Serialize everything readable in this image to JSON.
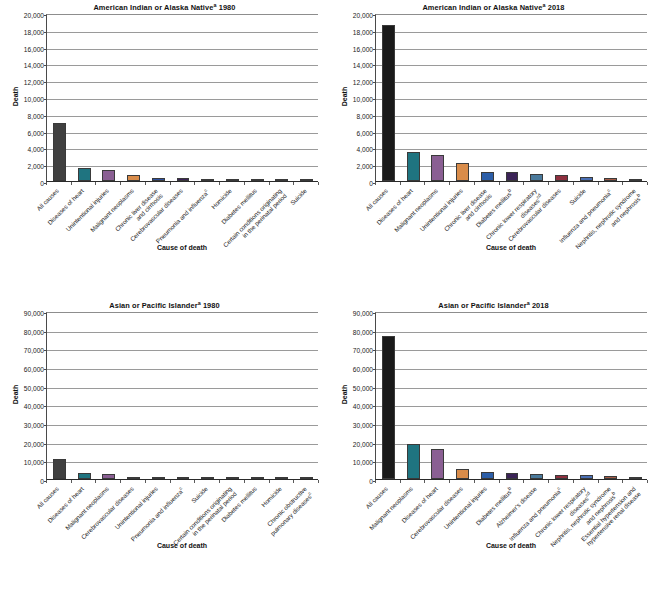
{
  "figure": {
    "axis_labels": {
      "x": "Cause of death",
      "y": "Death"
    },
    "caption": ""
  },
  "chart_data": [
    {
      "id": "american-indian-alaska-native-1980",
      "type": "bar",
      "title": "American Indian or Alaska Nativeᵃ 1980",
      "title_main": "American Indian or Alaska Native",
      "title_sup": "a",
      "title_year": "1980",
      "xlabel": "Cause of death",
      "ylabel": "Death",
      "ylim": [
        0,
        20000
      ],
      "yticks": [
        0,
        2000,
        4000,
        6000,
        8000,
        10000,
        12000,
        14000,
        16000,
        18000,
        20000
      ],
      "ytick_labels": [
        "0",
        "2,000",
        "4,000",
        "6,000",
        "8,000",
        "10,000",
        "12,000",
        "14,000",
        "16,000",
        "18,000",
        "20,000"
      ],
      "grid": true,
      "legend": "none",
      "categories": [
        "All causes",
        "Diseases of heart",
        "Unintentional injuries",
        "Malignant neoplasms",
        "Chronic liver disease and cirrhosis",
        "Cerebrovascular diseases",
        "Pneumonia and influenzaᶜ",
        "Homicide",
        "Diabetes mellitus",
        "Certain conditions originating in the perinatal period",
        "Suicide"
      ],
      "category_lines": [
        [
          "All causes"
        ],
        [
          "Diseases of heart"
        ],
        [
          "Unintentional injuries"
        ],
        [
          "Malignant neoplasms"
        ],
        [
          "Chronic liver disease",
          "and cirrhosis"
        ],
        [
          "Cerebrovascular diseases"
        ],
        [
          "Pneumonia and influenzaᶜ"
        ],
        [
          "Homicide"
        ],
        [
          "Diabetes mellitus"
        ],
        [
          "Certain conditions originating",
          "in the perinatal period"
        ],
        [
          "Suicide"
        ]
      ],
      "values": [
        6923,
        1494,
        1290,
        770,
        410,
        322,
        257,
        217,
        210,
        199,
        181
      ],
      "colors": [
        "#404040",
        "#1f7480",
        "#8a5f93",
        "#d98c4a",
        "#2c4f9e",
        "#3b2357",
        "#4a6d8c",
        "#8e2f3e",
        "#5b4fa0",
        "#a55b46",
        "#2f5c3a"
      ]
    },
    {
      "id": "american-indian-alaska-native-2018",
      "type": "bar",
      "title": "American Indian or Alaska Nativeᵃ 2018",
      "title_main": "American Indian or Alaska Native",
      "title_sup": "a",
      "title_year": "2018",
      "xlabel": "Cause of death",
      "ylabel": "Death",
      "ylim": [
        0,
        20000
      ],
      "yticks": [
        0,
        2000,
        4000,
        6000,
        8000,
        10000,
        12000,
        14000,
        16000,
        18000,
        20000
      ],
      "ytick_labels": [
        "0",
        "2,000",
        "4,000",
        "6,000",
        "8,000",
        "10,000",
        "12,000",
        "14,000",
        "16,000",
        "18,000",
        "20,000"
      ],
      "grid": true,
      "legend": "none",
      "categories": [
        "All causes",
        "Diseases of heart",
        "Malignant neoplasms",
        "Unintentional injuries",
        "Chronic liver disease and cirrhosis",
        "Diabetes mellitusᵇ",
        "Chronic lower respiratory diseasesᶜᵈ",
        "Cerebrovascular diseases",
        "Suicide",
        "Influenza and pneumoniaᶜ",
        "Nephritis, nephrotic syndrome and nephrosisᵇ"
      ],
      "category_lines": [
        [
          "All causes"
        ],
        [
          "Diseases of heart"
        ],
        [
          "Malignant neoplasms"
        ],
        [
          "Unintentional injuries"
        ],
        [
          "Chronic liver disease",
          "and cirrhosis"
        ],
        [
          "Diabetes mellitusᵇ"
        ],
        [
          "Chronic lower respiratory",
          "diseasesᶜᵈ"
        ],
        [
          "Cerebrovascular diseases"
        ],
        [
          "Suicide"
        ],
        [
          "Influenza and pneumoniaᶜ"
        ],
        [
          "Nephritis, nephrotic syndrome",
          "and nephrosisᵇ"
        ]
      ],
      "values": [
        18620,
        3400,
        3100,
        2100,
        1120,
        1050,
        780,
        660,
        520,
        380,
        290
      ],
      "colors": [
        "#1a1a1a",
        "#1f7480",
        "#8a5f93",
        "#d98c4a",
        "#2c5ea8",
        "#3b2357",
        "#4a7a9c",
        "#8e2f3e",
        "#4a6fb5",
        "#a55b46",
        "#2f5c3a"
      ]
    },
    {
      "id": "asian-pacific-islander-1980",
      "type": "bar",
      "title": "Asian or Pacific Islanderᵃ 1980",
      "title_main": "Asian or Pacific Islander",
      "title_sup": "a",
      "title_year": "1980",
      "xlabel": "Cause of death",
      "ylabel": "Death",
      "ylim": [
        0,
        90000
      ],
      "yticks": [
        0,
        10000,
        20000,
        30000,
        40000,
        50000,
        60000,
        70000,
        80000,
        90000
      ],
      "ytick_labels": [
        "0",
        "10,000",
        "20,000",
        "30,000",
        "40,000",
        "50,000",
        "60,000",
        "70,000",
        "80,000",
        "90,000"
      ],
      "grid": true,
      "legend": "none",
      "categories": [
        "All causes",
        "Diseases of heart",
        "Malignant neoplasms",
        "Cerebrovascular diseases",
        "Unintentional injuries",
        "Pneumonia and influenzaᶜ",
        "Suicide",
        "Certain conditions originating in the perinatal period",
        "Diabetes mellitus",
        "Homicide",
        "Chronic obstructive pulmonary diseasesᶜ"
      ],
      "category_lines": [
        [
          "All causes"
        ],
        [
          "Diseases of heart"
        ],
        [
          "Malignant neoplasms"
        ],
        [
          "Cerebrovascular diseases"
        ],
        [
          "Unintentional injuries"
        ],
        [
          "Pneumonia and influenzaᶜ"
        ],
        [
          "Suicide"
        ],
        [
          "Certain conditions originating",
          "in the perinatal period"
        ],
        [
          "Diabetes mellitus"
        ],
        [
          "Homicide"
        ],
        [
          "Chronic obstructive",
          "pulmonary diseasesᶜ"
        ]
      ],
      "values": [
        10809,
        3265,
        2522,
        1263,
        797,
        420,
        310,
        243,
        221,
        210,
        190
      ],
      "colors": [
        "#404040",
        "#1f7480",
        "#8a5f93",
        "#c4857d",
        "#3b2357",
        "#4a6d8c",
        "#8e2f3e",
        "#5b4fa0",
        "#a55b46",
        "#2f5c3a",
        "#4a6fb5"
      ]
    },
    {
      "id": "asian-pacific-islander-2018",
      "type": "bar",
      "title": "Asian or Pacific Islanderᵃ 2018",
      "title_main": "Asian or Pacific Islander",
      "title_sup": "a",
      "title_year": "2018",
      "xlabel": "Cause of death",
      "ylabel": "Death",
      "ylim": [
        0,
        90000
      ],
      "yticks": [
        0,
        10000,
        20000,
        30000,
        40000,
        50000,
        60000,
        70000,
        80000,
        90000
      ],
      "ytick_labels": [
        "0",
        "10,000",
        "20,000",
        "30,000",
        "40,000",
        "50,000",
        "60,000",
        "70,000",
        "80,000",
        "90,000"
      ],
      "grid": true,
      "legend": "none",
      "categories": [
        "All causes",
        "Malignant neoplasms",
        "Diseases of heart",
        "Cerebrovascular diseases",
        "Unintentional injuries",
        "Diabetes mellitusᵇ",
        "Alzheimer's disease",
        "Influenza and pneumoniaᶜ",
        "Chronic lower respiratory diseasesᶜᵈ",
        "Nephritis, nephrotic syndrome and nephrosisᵇ",
        "Essential hypertension and hypertensive renal disease"
      ],
      "category_lines": [
        [
          "All causes"
        ],
        [
          "Malignant neoplasms"
        ],
        [
          "Diseases of heart"
        ],
        [
          "Cerebrovascular diseases"
        ],
        [
          "Unintentional injuries"
        ],
        [
          "Diabetes mellitusᵇ"
        ],
        [
          "Alzheimer's disease"
        ],
        [
          "Influenza and pneumoniaᶜ"
        ],
        [
          "Chronic lower respiratory",
          "diseasesᶜᵈ"
        ],
        [
          "Nephritis, nephrotic syndrome",
          "and nephrosisᵇ"
        ],
        [
          "Essential hypertension and",
          "hypertensive renal disease"
        ]
      ],
      "values": [
        76700,
        19000,
        16300,
        5600,
        3700,
        3250,
        2900,
        2400,
        2200,
        1600,
        1250
      ],
      "colors": [
        "#1a1a1a",
        "#1f7480",
        "#8a5f93",
        "#d98c4a",
        "#2c5ea8",
        "#3b2357",
        "#4a7a9c",
        "#8e2f3e",
        "#4a6fb5",
        "#a55b46",
        "#2f5c3a"
      ]
    }
  ]
}
